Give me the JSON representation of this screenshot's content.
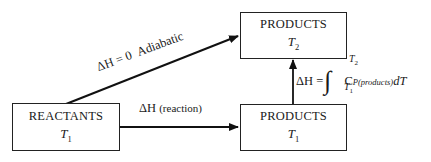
{
  "diagram": {
    "type": "thermodynamic-path-diagram",
    "nodes": [
      {
        "id": "reactants",
        "title": "REACTANTS",
        "temp_symbol": "T",
        "temp_sub": "1"
      },
      {
        "id": "products_t1",
        "title": "PRODUCTS",
        "temp_symbol": "T",
        "temp_sub": "1"
      },
      {
        "id": "products_t2",
        "title": "PRODUCTS",
        "temp_symbol": "T",
        "temp_sub": "2"
      }
    ],
    "edges": [
      {
        "from": "reactants",
        "to": "products_t2",
        "label_lhs": "ΔH = 0",
        "label_rhs": "Adiabatic"
      },
      {
        "from": "reactants",
        "to": "products_t1",
        "label_sym": "ΔH",
        "label_paren": "(reaction)"
      },
      {
        "from": "products_t1",
        "to": "products_t2",
        "label_lhs": "ΔH =",
        "integral_upper": "T",
        "integral_upper_sub": "2",
        "integral_lower": "T",
        "integral_lower_sub": "1",
        "integrand_c": "C",
        "integrand_sub": "P(products)",
        "integrand_d": "dT"
      }
    ]
  }
}
